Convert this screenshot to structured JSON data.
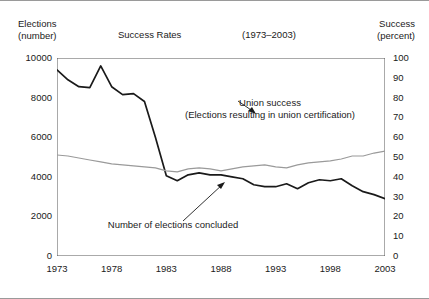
{
  "header": {
    "left_axis_title": "Elections\n(number)",
    "chart_title": "Success Rates",
    "period": "(1973–2003)",
    "right_axis_title": "Success\n(percent)"
  },
  "annotations": {
    "union_success": "Union success\n(Elections resulting in union certification)",
    "elections_concluded": "Number of elections concluded"
  },
  "colors": {
    "elections_line": "#1a1a1a",
    "success_line": "#9a9a9a",
    "axis": "#555555",
    "frame": "#9a9a9a"
  },
  "chart_data": {
    "type": "line",
    "title": "Success Rates",
    "subtitle": "(1973–2003)",
    "xlabel": "",
    "ylabel": "Elections (number)",
    "y2label": "Success (percent)",
    "grid": false,
    "legend": "annotations",
    "xlim": [
      1973,
      2003
    ],
    "ylim": [
      0,
      10000
    ],
    "y2lim": [
      0,
      100
    ],
    "yticks": [
      0,
      2000,
      4000,
      6000,
      8000,
      10000
    ],
    "y2ticks": [
      0,
      10,
      20,
      30,
      40,
      50,
      60,
      70,
      80,
      90,
      100
    ],
    "xticks_labeled": [
      1973,
      1978,
      1983,
      1988,
      1993,
      1998,
      2003
    ],
    "x": [
      1973,
      1974,
      1975,
      1976,
      1977,
      1978,
      1979,
      1980,
      1981,
      1982,
      1983,
      1984,
      1985,
      1986,
      1987,
      1988,
      1989,
      1990,
      1991,
      1992,
      1993,
      1994,
      1995,
      1996,
      1997,
      1998,
      1999,
      2000,
      2001,
      2002,
      2003
    ],
    "series": [
      {
        "name": "Number of elections concluded",
        "axis": "left",
        "color": "#1a1a1a",
        "units": "number",
        "values": [
          9400,
          8900,
          8550,
          8500,
          9600,
          8550,
          8150,
          8200,
          7800,
          6000,
          4050,
          3800,
          4100,
          4200,
          4100,
          4100,
          4000,
          3900,
          3600,
          3500,
          3500,
          3650,
          3400,
          3700,
          3850,
          3800,
          3900,
          3550,
          3250,
          3100,
          2900
        ]
      },
      {
        "name": "Union success (Elections resulting in union certification)",
        "axis": "right",
        "color": "#9a9a9a",
        "units": "percent",
        "values": [
          51,
          50.5,
          49.5,
          48.5,
          47.5,
          46.5,
          46,
          45.5,
          45,
          44.5,
          43,
          42.5,
          44,
          44.5,
          44,
          43,
          44,
          45,
          45.5,
          46,
          45,
          44.5,
          46,
          47,
          47.5,
          48,
          49,
          50.5,
          50.5,
          52,
          53
        ]
      }
    ]
  }
}
